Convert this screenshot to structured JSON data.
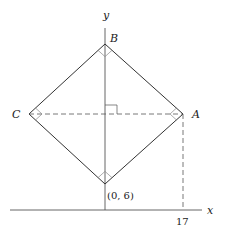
{
  "diagram": {
    "axes": {
      "x_label": "x",
      "y_label": "y"
    },
    "vertices": {
      "A": "A",
      "B": "B",
      "C": "C",
      "bottom": "(0, 6)"
    },
    "tick_labels": {
      "x_tick": "17"
    },
    "colors": {
      "line": "#333333",
      "axis": "#555555",
      "background": "#ffffff"
    }
  }
}
